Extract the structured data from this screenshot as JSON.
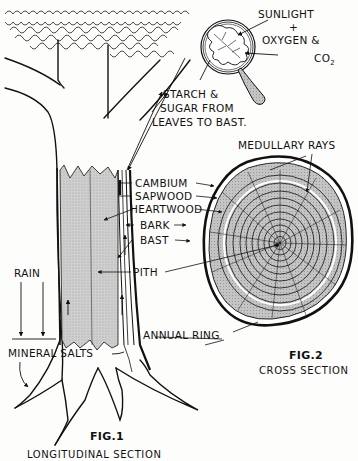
{
  "page": {
    "top_text_fragment": "...urally, is found a thin layer of bark, from the kambium...",
    "figures": [
      {
        "id": "fig1",
        "figure_label": "FIG.1",
        "caption": "LONGITUDINAL SECTION",
        "labels": {
          "sunlight": "SUNLIGHT",
          "plus": "+",
          "oxygen": "OXYGEN &",
          "co2_main": "CO",
          "co2_sub": "2",
          "starch_line1": "STARCH &",
          "starch_line2": "SUGAR FROM",
          "starch_line3": "LEAVES TO BAST.",
          "cambium": "CAMBIUM",
          "sapwood": "SAPWOOD",
          "heartwood": "HEARTWOOD",
          "bark": "BARK",
          "bast": "BAST",
          "pith": "PITH",
          "rain": "RAIN",
          "mineral_salts": "MINERAL SALTS"
        }
      },
      {
        "id": "fig2",
        "figure_label": "FIG.2",
        "caption": "CROSS SECTION",
        "labels": {
          "medullary_rays": "MEDULLARY RAYS",
          "annual_ring": "ANNUAL RING"
        }
      }
    ],
    "colors": {
      "ink": "#111111",
      "heartwood_fill": "#c9c9c9",
      "ring_fill": "#bdbdbd",
      "paper": "#fdfdfc"
    }
  }
}
